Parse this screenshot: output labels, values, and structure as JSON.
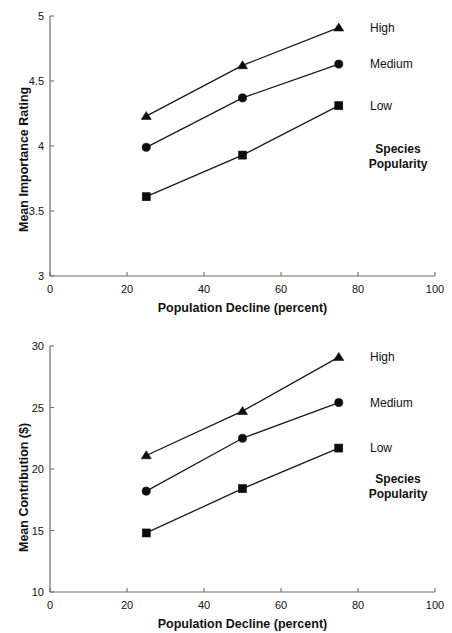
{
  "chart_data": [
    {
      "id": "importance-rating",
      "type": "line",
      "title": "",
      "xlabel": "Population Decline (percent)",
      "ylabel": "Mean Importance Rating",
      "x": [
        25,
        50,
        75
      ],
      "xlim": [
        0,
        100
      ],
      "ylim": [
        3,
        5
      ],
      "xticks": [
        0,
        20,
        40,
        60,
        80,
        100
      ],
      "xtick_labels": [
        "0",
        "20",
        "40",
        "60",
        "80",
        "100"
      ],
      "yticks": [
        3,
        3.5,
        4,
        4.5,
        5
      ],
      "ytick_labels": [
        "3",
        "3.5",
        "4",
        "4.5",
        "5"
      ],
      "grid": false,
      "legend_position": "right",
      "legend_title": "Species\nPopularity",
      "legend_title_line1": "Species",
      "legend_title_line2": "Popularity",
      "series": [
        {
          "name": "High",
          "marker": "triangle",
          "values": [
            4.23,
            4.62,
            4.91
          ]
        },
        {
          "name": "Medium",
          "marker": "circle",
          "values": [
            3.99,
            4.37,
            4.63
          ]
        },
        {
          "name": "Low",
          "marker": "square",
          "values": [
            3.61,
            3.93,
            4.31
          ]
        }
      ]
    },
    {
      "id": "mean-contribution",
      "type": "line",
      "title": "",
      "xlabel": "Population Decline (percent)",
      "ylabel": "Mean Contribution ($)",
      "x": [
        25,
        50,
        75
      ],
      "xlim": [
        0,
        100
      ],
      "ylim": [
        10,
        30
      ],
      "xticks": [
        0,
        20,
        40,
        60,
        80,
        100
      ],
      "xtick_labels": [
        "0",
        "20",
        "40",
        "60",
        "80",
        "100"
      ],
      "yticks": [
        10,
        15,
        20,
        25,
        30
      ],
      "ytick_labels": [
        "10",
        "15",
        "20",
        "25",
        "30"
      ],
      "grid": false,
      "legend_position": "right",
      "legend_title": "Species\nPopularity",
      "legend_title_line1": "Species",
      "legend_title_line2": "Popularity",
      "series": [
        {
          "name": "High",
          "marker": "triangle",
          "values": [
            21.1,
            24.7,
            29.1
          ]
        },
        {
          "name": "Medium",
          "marker": "circle",
          "values": [
            18.2,
            22.5,
            25.4
          ]
        },
        {
          "name": "Low",
          "marker": "square",
          "values": [
            14.8,
            18.4,
            21.7
          ]
        }
      ]
    }
  ],
  "colors": {
    "ink": "#111111",
    "axis": "#6d6d6d",
    "marker": "#0d0d0d",
    "background": "#ffffff"
  }
}
